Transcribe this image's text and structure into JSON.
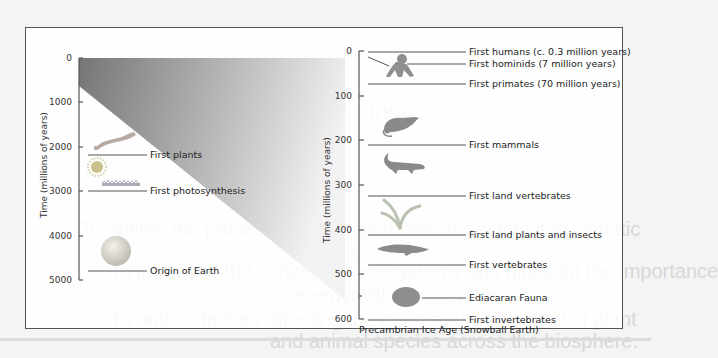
{
  "background_text": {
    "line1": "To outline the process of photosynthesis and relate it to climatic",
    "line2": "controls.",
    "line3": "To introduce the concept of ecosystems and highlight the importance",
    "line4": "energy within ecosystems.",
    "line5": "To outline factors affecting the geographic dispersal of plant",
    "line6": "and animal species across the biosphere.",
    "heading": "Intro"
  },
  "left_panel": {
    "axis_title": "Time (millions of years)",
    "ticks": [
      "0",
      "1000",
      "2000",
      "3000",
      "4000",
      "5000"
    ],
    "events": [
      {
        "label": "First plants",
        "icon": "seaweed-icon"
      },
      {
        "label": "First photosynthesis",
        "icon": "stromatolite-icon"
      },
      {
        "label": "Origin of Earth",
        "icon": "earth-icon"
      }
    ],
    "extra_icons": [
      "sun-icon"
    ]
  },
  "right_panel": {
    "axis_title": "Time (millions of years)",
    "ticks": [
      "0",
      "100",
      "200",
      "300",
      "400",
      "500",
      "600"
    ],
    "events": [
      {
        "label": "First humans (c. 0.3 million years)",
        "icon": ""
      },
      {
        "label": "First hominids (7 million years)",
        "icon": "ape-icon"
      },
      {
        "label": "First primates (70 million years)",
        "icon": ""
      },
      {
        "label": "First mammals",
        "icon": "mammal-icon"
      },
      {
        "label": "First land vertebrates",
        "icon": "reptile-icon"
      },
      {
        "label": "First land plants and insects",
        "icon": "plant-icon"
      },
      {
        "label": "First vertebrates",
        "icon": "fish-icon"
      },
      {
        "label": "Ediacaran Fauna",
        "icon": "ediacaran-icon"
      },
      {
        "label": "First invertebrates",
        "icon": ""
      }
    ],
    "footer": "Precambrian Ice Age (Snowball Earth)"
  },
  "colors": {
    "gradient_dark": "#6e6e6e",
    "gradient_light": "#f2f2f2",
    "axis": "#555555",
    "icon_fill": "#8a8a8a"
  }
}
